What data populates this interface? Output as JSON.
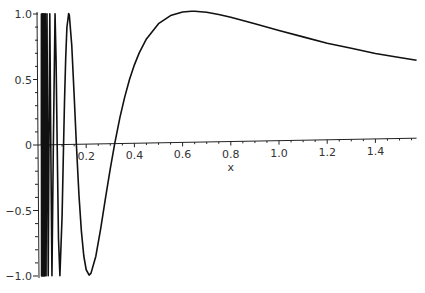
{
  "chart_data": {
    "type": "line",
    "title": "",
    "function": "sin(1/x)",
    "xlabel": "x",
    "ylabel": "",
    "xlim": [
      0,
      1.5708
    ],
    "ylim": [
      -1,
      1
    ],
    "grid": false,
    "legend": "none",
    "x_ticks": [
      {
        "value": 0.2,
        "label": "0.2"
      },
      {
        "value": 0.4,
        "label": "0.4"
      },
      {
        "value": 0.6,
        "label": "0.6"
      },
      {
        "value": 0.8,
        "label": "0.8"
      },
      {
        "value": 1.0,
        "label": "1.0"
      },
      {
        "value": 1.2,
        "label": "1.2"
      },
      {
        "value": 1.4,
        "label": "1.4"
      }
    ],
    "y_ticks": [
      {
        "value": 1.0,
        "label": "1.0"
      },
      {
        "value": 0.5,
        "label": "0.5"
      },
      {
        "value": 0,
        "label": "0"
      },
      {
        "value": -0.5,
        "label": "−0.5"
      },
      {
        "value": -1.0,
        "label": "−1.0"
      }
    ],
    "series": [
      {
        "name": "sin(1/x)",
        "x": [
          1.5708,
          1.5,
          1.4,
          1.3,
          1.2,
          1.1,
          1.0,
          0.9,
          0.8,
          0.75,
          0.7,
          0.65,
          0.6366,
          0.6,
          0.55,
          0.5,
          0.45,
          0.42,
          0.4,
          0.38,
          0.36,
          0.34,
          0.3183,
          0.3,
          0.28,
          0.26,
          0.24,
          0.22,
          0.2122,
          0.2,
          0.19,
          0.18,
          0.17,
          0.1592,
          0.15,
          0.14,
          0.13,
          0.1273,
          0.12,
          0.115,
          0.11,
          0.1061,
          0.1,
          0.0909,
          0.085,
          0.0796,
          0.075,
          0.0707,
          0.0637,
          0.0579,
          0.0531,
          0.049,
          0.0455,
          0.0424,
          0.0398,
          0.0374,
          0.0354,
          0.0335,
          0.0318,
          0.0303,
          0.0289,
          0.0277,
          0.0265,
          0.0255,
          0.0245,
          0.0236,
          0.0227,
          0.022,
          0.0212,
          0.0205,
          0.0199,
          0.0193,
          0.0187,
          0.0182,
          0.0177,
          0.0172,
          0.0167,
          0.0163,
          0.0159,
          0.0155,
          0.0152,
          0.0148,
          0.0145,
          0.0142,
          0.0139
        ],
        "y": [
          0.5949,
          0.6184,
          0.6516,
          0.696,
          0.7375,
          0.7891,
          0.8415,
          0.896,
          0.949,
          0.9719,
          0.9901,
          0.9997,
          1.0,
          0.9954,
          0.9696,
          0.9093,
          0.7952,
          0.6893,
          0.5985,
          0.4887,
          0.3557,
          0.2,
          0.0,
          -0.1906,
          -0.4154,
          -0.6486,
          -0.8565,
          -0.9853,
          -1.0,
          -0.9589,
          -0.8536,
          -0.6634,
          -0.3895,
          0.0,
          0.3742,
          0.7582,
          0.9871,
          1.0,
          0.895,
          0.6641,
          0.3282,
          0.0,
          -0.544,
          -1.0,
          -0.7155,
          0.0,
          0.6503,
          1.0,
          0.0,
          -1.0,
          0.0,
          1.0,
          0.0,
          -1.0,
          0.0,
          1.0,
          0.0,
          -1.0,
          0.0,
          1.0,
          0.0,
          -1.0,
          0.0,
          1.0,
          0.0,
          -1.0,
          0.0,
          1.0,
          0.0,
          -1.0,
          0.0,
          1.0,
          0.0,
          -1.0,
          0.0,
          1.0,
          0.0,
          -1.0,
          0.0,
          1.0,
          0.0,
          -1.0,
          0.0,
          1.0,
          0.0
        ]
      }
    ]
  }
}
